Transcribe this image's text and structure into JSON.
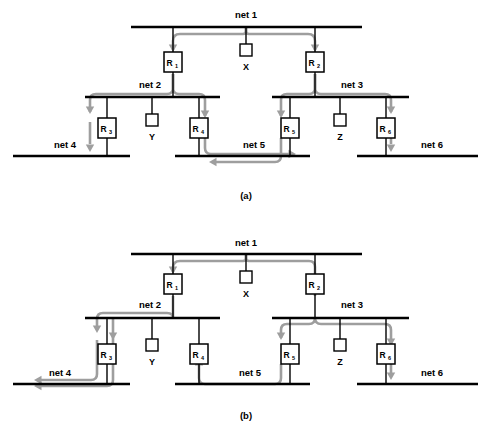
{
  "figure": {
    "width": 493,
    "height": 445,
    "background": "#ffffff",
    "wire_color": "#000000",
    "route_color": "#9e9e9e",
    "box_fill": "#ffffff",
    "box_stroke": "#000000"
  },
  "panels": [
    {
      "id": "a",
      "caption": "(a)",
      "caption_x": 246,
      "caption_y": 199,
      "nets": [
        {
          "name": "net 1",
          "label_x": 246,
          "label_y": 18,
          "x1": 131,
          "x2": 362,
          "y": 27
        },
        {
          "name": "net 2",
          "label_x": 150,
          "label_y": 88,
          "x1": 85,
          "x2": 220,
          "y": 97
        },
        {
          "name": "net 3",
          "label_x": 352,
          "label_y": 88,
          "x1": 272,
          "x2": 409,
          "y": 97
        },
        {
          "name": "net 4",
          "label_x": 65,
          "label_y": 148,
          "x1": 13,
          "x2": 130,
          "y": 156
        },
        {
          "name": "net 5",
          "label_x": 254,
          "label_y": 148,
          "x1": 175,
          "x2": 310,
          "y": 156
        },
        {
          "name": "net 6",
          "label_x": 432,
          "label_y": 148,
          "x1": 357,
          "x2": 478,
          "y": 156
        }
      ],
      "resistors": [
        {
          "name": "R",
          "sub": "1",
          "cx": 173,
          "cy": 62
        },
        {
          "name": "R",
          "sub": "2",
          "cx": 315,
          "cy": 62
        },
        {
          "name": "R",
          "sub": "3",
          "cx": 107,
          "cy": 128
        },
        {
          "name": "R",
          "sub": "4",
          "cx": 199,
          "cy": 128
        },
        {
          "name": "R",
          "sub": "5",
          "cx": 290,
          "cy": 128
        },
        {
          "name": "R",
          "sub": "6",
          "cx": 386,
          "cy": 128
        }
      ],
      "pins": [
        {
          "name": "X",
          "cx": 246,
          "cy": 50,
          "stub_from_y": 27,
          "label_y": 70
        },
        {
          "name": "Y",
          "cx": 152,
          "cy": 120,
          "stub_from_y": 97,
          "label_y": 140
        },
        {
          "name": "Z",
          "cx": 340,
          "cy": 120,
          "stub_from_y": 97,
          "label_y": 140
        }
      ],
      "stems": [
        {
          "x": 173,
          "y1": 27,
          "y2": 97
        },
        {
          "x": 315,
          "y1": 27,
          "y2": 97
        },
        {
          "x": 107,
          "y1": 97,
          "y2": 156
        },
        {
          "x": 199,
          "y1": 97,
          "y2": 156
        },
        {
          "x": 290,
          "y1": 97,
          "y2": 156
        },
        {
          "x": 386,
          "y1": 97,
          "y2": 156
        }
      ],
      "routes": [
        {
          "d": "M 246 27 L 246 31 Q 246 34 243 34 L 180 34 Q 173 34 173 41 L 173 50",
          "arrow": "down",
          "ax": 173,
          "ay": 52
        },
        {
          "d": "M 246 27 L 246 31 Q 246 34 249 34 L 308 34 Q 315 34 315 41 L 315 50",
          "arrow": "down",
          "ax": 315,
          "ay": 52
        },
        {
          "d": "M 173 74 L 173 88 Q 173 94 167 94 L 96 94 Q 90 94 90 100 L 90 112",
          "arrow": "down",
          "ax": 90,
          "ay": 114
        },
        {
          "d": "M 173 74 L 173 88 Q 173 94 179 94 L 199 94 Q 205 94 205 100 L 205 116",
          "arrow": "down",
          "ax": 205,
          "ay": 118
        },
        {
          "d": "M 315 74 L 315 88 Q 315 94 309 94 L 287 94 Q 281 94 281 100 L 281 116",
          "arrow": "down",
          "ax": 281,
          "ay": 118
        },
        {
          "d": "M 315 74 L 315 88 Q 315 94 321 94 L 385 94 Q 391 94 391 100 L 391 112",
          "arrow": "down",
          "ax": 391,
          "ay": 114
        },
        {
          "d": "M 90 122 L 90 144",
          "arrow": "down",
          "ax": 90,
          "ay": 152
        },
        {
          "d": "M 391 122 L 391 144",
          "arrow": "down",
          "ax": 391,
          "ay": 152
        },
        {
          "d": "M 205 138 L 205 148 Q 205 154 211 154 L 290 154",
          "arrow": "right",
          "ax": 296,
          "ay": 154
        },
        {
          "d": "M 281 138 L 281 156 Q 281 162 275 162 L 215 162",
          "arrow": "left",
          "ax": 209,
          "ay": 162
        }
      ]
    },
    {
      "id": "b",
      "caption": "(b)",
      "caption_x": 246,
      "caption_y": 419,
      "nets": [
        {
          "name": "net 1",
          "label_x": 246,
          "label_y": 246,
          "x1": 131,
          "x2": 362,
          "y": 254
        },
        {
          "name": "net 2",
          "label_x": 150,
          "label_y": 308,
          "x1": 85,
          "x2": 220,
          "y": 318
        },
        {
          "name": "net 3",
          "label_x": 352,
          "label_y": 308,
          "x1": 272,
          "x2": 409,
          "y": 318
        },
        {
          "name": "net 4",
          "label_x": 60,
          "label_y": 376,
          "x1": 13,
          "x2": 130,
          "y": 384
        },
        {
          "name": "net 5",
          "label_x": 250,
          "label_y": 376,
          "x1": 175,
          "x2": 310,
          "y": 384
        },
        {
          "name": "net 6",
          "label_x": 432,
          "label_y": 376,
          "x1": 357,
          "x2": 478,
          "y": 384
        }
      ],
      "resistors": [
        {
          "name": "R",
          "sub": "1",
          "cx": 173,
          "cy": 284
        },
        {
          "name": "R",
          "sub": "2",
          "cx": 315,
          "cy": 284
        },
        {
          "name": "R",
          "sub": "3",
          "cx": 107,
          "cy": 354
        },
        {
          "name": "R",
          "sub": "4",
          "cx": 199,
          "cy": 354
        },
        {
          "name": "R",
          "sub": "5",
          "cx": 290,
          "cy": 354
        },
        {
          "name": "R",
          "sub": "6",
          "cx": 386,
          "cy": 354
        }
      ],
      "pins": [
        {
          "name": "X",
          "cx": 246,
          "cy": 277,
          "stub_from_y": 254,
          "label_y": 297
        },
        {
          "name": "Y",
          "cx": 152,
          "cy": 345,
          "stub_from_y": 318,
          "label_y": 365
        },
        {
          "name": "Z",
          "cx": 340,
          "cy": 345,
          "stub_from_y": 318,
          "label_y": 365
        }
      ],
      "stems": [
        {
          "x": 173,
          "y1": 254,
          "y2": 318
        },
        {
          "x": 315,
          "y1": 254,
          "y2": 318
        },
        {
          "x": 107,
          "y1": 318,
          "y2": 384
        },
        {
          "x": 199,
          "y1": 318,
          "y2": 384
        },
        {
          "x": 290,
          "y1": 318,
          "y2": 384
        },
        {
          "x": 386,
          "y1": 318,
          "y2": 384
        }
      ],
      "routes": [
        {
          "d": "M 246 254 L 246 258 Q 246 261 243 261 L 180 261 Q 173 261 173 268 L 173 272",
          "arrow": "down",
          "ax": 173,
          "ay": 274
        },
        {
          "d": "M 173 296 L 173 318",
          "arrow": "none",
          "ax": 0,
          "ay": 0
        },
        {
          "d": "M 173 318 Q 173 313 167 313 L 103 313 Q 97 313 97 319 L 97 330",
          "arrow": "down",
          "ax": 97,
          "ay": 333
        },
        {
          "d": "M 246 254 L 246 258 Q 246 261 249 261 L 309 261 Q 315 261 315 267 L 315 296",
          "arrow": "up",
          "ax": 315,
          "ay": 273
        },
        {
          "d": "M 315 318 Q 315 324 309 324 L 287 324 Q 281 324 281 330 L 281 338",
          "arrow": "down",
          "ax": 281,
          "ay": 340
        },
        {
          "d": "M 315 318 Q 315 324 321 324 L 385 324 Q 391 324 391 330 L 391 344",
          "arrow": "down",
          "ax": 391,
          "ay": 346
        },
        {
          "d": "M 391 364 L 391 374",
          "arrow": "down",
          "ax": 391,
          "ay": 380
        },
        {
          "d": "M 281 364 L 281 378 Q 281 384 275 384 L 205 384 Q 199 384 199 378 L 199 364",
          "arrow": "up",
          "ax": 199,
          "ay": 358
        },
        {
          "d": "M 97 340 L 97 374 Q 97 380 91 380 L 40 380",
          "arrow": "left",
          "ax": 34,
          "ay": 380
        },
        {
          "d": "M 113 364 L 113 380 Q 113 386 107 386 L 40 386",
          "arrow": "left",
          "ax": 34,
          "ay": 386
        },
        {
          "d": "M 113 318 Q 113 324 113 330 L 113 344",
          "arrow": "down",
          "ax": 113,
          "ay": 340
        }
      ]
    }
  ]
}
